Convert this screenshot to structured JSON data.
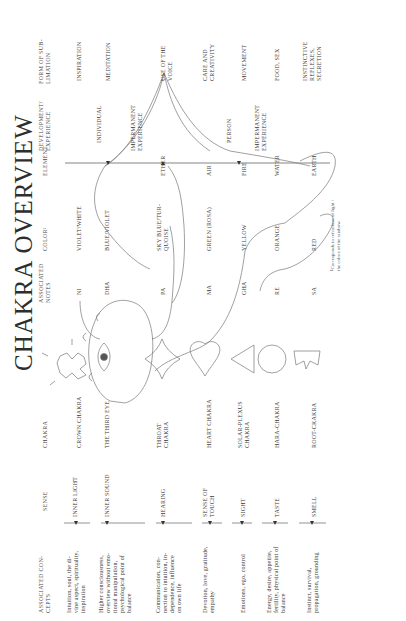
{
  "title": "CHAKRA OVERVIEW",
  "headers": {
    "concepts": "ASSOCIATED CON-\nCEPTS",
    "sense": "SENSE",
    "chakra": "CHAKRA",
    "notes": "ASSOCIATED\nNOTES",
    "color": "COLOR¹",
    "element": "ELEMENT",
    "development": "DEVELOPMENT/\nEXPERIENCE",
    "sublimation": "FORM OF SUB-\nLIMATION"
  },
  "rows": [
    {
      "concepts": "Intuition, soul, the di-\nvine aspect, spirituality,\ninspiration",
      "sense": "INNER LIGHT",
      "chakra": "CROWN CHAKRA",
      "note": "NI",
      "color": "VIOLET/WHITE",
      "element": "",
      "development": "",
      "sublimation": "INSPIRATION"
    },
    {
      "concepts": "Higher consciousness,\noverview without emo-\ntional manipulation,\npsychological point of\nbalance",
      "sense": "INNER SOUND",
      "chakra": "THE THIRD EYE",
      "note": "DHA",
      "color": "BLUE/VIOLET",
      "element": "",
      "development": "INDIVIDUAL",
      "sublimation": "MEDITATION"
    },
    {
      "concepts": "Communication, con-\nnection to intuition, in-\ndependence, influence\non own life",
      "sense": "HEARING",
      "chakra": "THROAT\nCHAKRA",
      "note": "PA",
      "color": "SKY BLUE/TUR-\nQUOISE",
      "element": "ETHER",
      "development": "IMPERMANENT\nEXPERIENCE",
      "sublimation": "USE OF THE\nVOICE"
    },
    {
      "concepts": "Devotion, love, gratitude,\nempathy",
      "sense": "SENSE OF\nTOUCH",
      "chakra": "HEART CHAKRA",
      "note": "MA",
      "color": "GREEN (ROSA)",
      "element": "AIR",
      "development": "PERSON",
      "sublimation": "CARE AND\nCREATIVITY"
    },
    {
      "concepts": "Emotions, ego, control",
      "sense": "SIGHT",
      "chakra": "SOLAR-PLEXUS\nCHAKRA",
      "note": "GHA",
      "color": "YELLOW",
      "element": "FIRE",
      "development": "IMPERMANENT\nEXPERIENCE",
      "sublimation": "MOVEMENT"
    },
    {
      "concepts": "Energy, desire, appetite,\nfertility, physical point of\nbalance",
      "sense": "TASTE",
      "chakra": "HARA-CHAKRA",
      "note": "RE",
      "color": "ORANGE",
      "element": "WATER",
      "development": "",
      "sublimation": "FOOD, SEX"
    },
    {
      "concepts": "Instinct, survival,\npropagation, grounding",
      "sense": "SMELL",
      "chakra": "ROOT-CKAKRA",
      "note": "SA",
      "color": "RED",
      "element": "EARTH",
      "development": "",
      "sublimation": "INSTINCTIVE\nREFLEXES,\nSECRETION"
    }
  ],
  "footnote": "¹Corresponds to refraction of light /\nthe colors of the rainbow.",
  "icons": {
    "crown": "crown-icon",
    "third_eye": "eye-icon",
    "throat": "four-point-star-icon",
    "heart": "heart-icon",
    "solar_plexus": "triangle-icon",
    "hara": "circle-icon",
    "root": "root-crown-icon"
  }
}
